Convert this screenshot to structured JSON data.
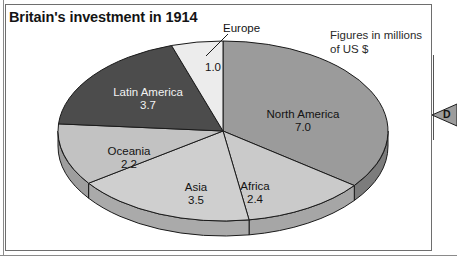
{
  "figure": {
    "title": "Britain's investment in 1914",
    "units_note": "Figures in millions\nof US $",
    "edge_marker_label": "D",
    "europe_callout": "Europe"
  },
  "chart_data": {
    "type": "pie",
    "title": "Britain's investment in 1914",
    "subtitle": "Figures in millions of US $",
    "unit": "millions of US $",
    "style": "3d-pie",
    "total": 19.8,
    "categories": [
      "North America",
      "Africa",
      "Asia",
      "Oceania",
      "Latin America",
      "Europe"
    ],
    "values": [
      7.0,
      2.4,
      3.5,
      2.2,
      3.7,
      1.0
    ],
    "legend": "none",
    "labels_inside": true,
    "slices": [
      {
        "name": "North America",
        "value": "7.0",
        "value_num": 7.0,
        "color": "#9b9b9b",
        "side_color": "#7c7c7c",
        "label_color": "dark",
        "label_x": 303,
        "label_y": 108
      },
      {
        "name": "Africa",
        "value": "2.4",
        "value_num": 2.4,
        "color": "#cacaca",
        "side_color": "#a6a6a6",
        "label_color": "dark",
        "label_x": 255,
        "label_y": 180
      },
      {
        "name": "Asia",
        "value": "3.5",
        "value_num": 3.5,
        "color": "#cfcfcf",
        "side_color": "#aaaaaa",
        "label_color": "dark",
        "label_x": 196,
        "label_y": 181
      },
      {
        "name": "Oceania",
        "value": "2.2",
        "value_num": 2.2,
        "color": "#c2c2c2",
        "side_color": "#9e9e9e",
        "label_color": "dark",
        "label_x": 129,
        "label_y": 145
      },
      {
        "name": "Latin America",
        "value": "3.7",
        "value_num": 3.7,
        "color": "#4c4c4c",
        "side_color": "#3a3a3a",
        "label_color": "light",
        "label_x": 148,
        "label_y": 86
      },
      {
        "name": "Europe",
        "value": "1.0",
        "value_num": 1.0,
        "color": "#ececec",
        "side_color": "#c4c4c4",
        "label_color": "dark",
        "label_x": 213,
        "label_y": 61
      }
    ]
  },
  "colors": {
    "background": "#ffffff",
    "frame": "#6e6e6e",
    "text": "#131313",
    "outline": "#1a1a1a"
  }
}
